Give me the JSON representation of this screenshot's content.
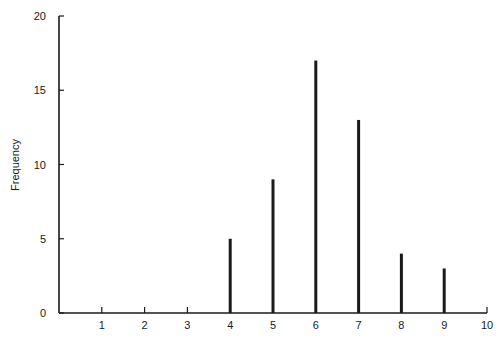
{
  "chart_data": {
    "type": "bar",
    "title": "",
    "xlabel": "",
    "ylabel": "Frequency",
    "categories": [
      "4",
      "5",
      "6",
      "7",
      "8",
      "9"
    ],
    "x": [
      4,
      5,
      6,
      7,
      8,
      9
    ],
    "values": [
      5,
      9,
      17,
      13,
      4,
      3
    ],
    "xlim": [
      0,
      10
    ],
    "ylim": [
      0,
      20
    ],
    "xticks": [
      1,
      2,
      3,
      4,
      5,
      6,
      7,
      8,
      9,
      10
    ],
    "yticks": [
      0,
      5,
      10,
      15,
      20
    ],
    "grid": false,
    "legend": null,
    "bar_style": "thin vertical lines (spike plot)"
  },
  "colors": {
    "ink": "#1a1a1a",
    "background": "#ffffff"
  }
}
